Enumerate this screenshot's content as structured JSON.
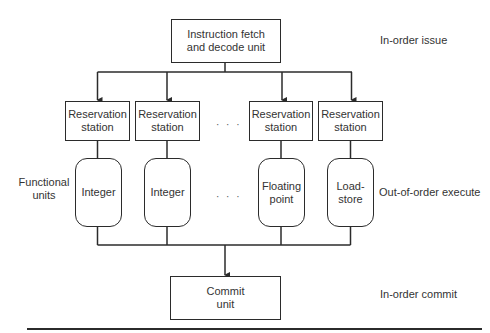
{
  "diagram": {
    "top_unit": {
      "label": "Instruction fetch\nand decode unit"
    },
    "reservation_stations": [
      {
        "label": "Reservation\nstation"
      },
      {
        "label": "Reservation\nstation"
      },
      {
        "label": "Reservation\nstation"
      },
      {
        "label": "Reservation\nstation"
      }
    ],
    "functional_units": [
      {
        "label": "Integer"
      },
      {
        "label": "Integer"
      },
      {
        "label": "Floating\npoint"
      },
      {
        "label": "Load-\nstore"
      }
    ],
    "commit_unit": {
      "label": "Commit\nunit"
    },
    "ellipsis": "· · ·",
    "side_labels": {
      "functional_units": "Functional\nunits",
      "in_order_issue": "In-order issue",
      "out_of_order_execute": "Out-of-order execute",
      "in_order_commit": "In-order commit"
    },
    "colors": {
      "line": "#2b2b2b",
      "text": "#333333",
      "background": "#ffffff"
    }
  }
}
